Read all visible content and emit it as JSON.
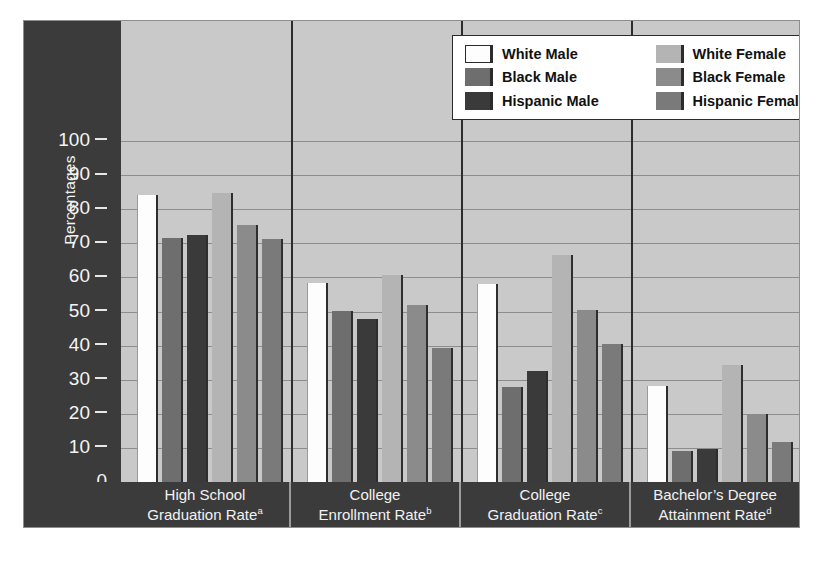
{
  "chart_data": {
    "type": "bar",
    "title": "",
    "xlabel": "",
    "ylabel": "Percentages",
    "ylim": [
      0,
      100
    ],
    "yticks": [
      100,
      90,
      80,
      70,
      60,
      50,
      40,
      30,
      20,
      10,
      0
    ],
    "grid": true,
    "legend_position": "top-right",
    "categories": [
      "High School Graduation Rate",
      "College Enrollment Rate",
      "College Graduation Rate",
      "Bachelor's Degree Attainment Rate"
    ],
    "category_footnotes": [
      "a",
      "b",
      "c",
      "d"
    ],
    "series": [
      {
        "name": "White Male",
        "values": [
          84.3,
          58.5,
          58.0,
          28.2
        ]
      },
      {
        "name": "Black Male",
        "values": [
          71.6,
          50.2,
          27.9,
          9.1
        ]
      },
      {
        "name": "Hispanic Male",
        "values": [
          72.3,
          47.7,
          32.5,
          9.6
        ]
      },
      {
        "name": "White Female",
        "values": [
          84.8,
          60.7,
          66.5,
          34.4
        ]
      },
      {
        "name": "Black Female",
        "values": [
          75.5,
          51.8,
          50.4,
          20.0
        ]
      },
      {
        "name": "Hispanic Female",
        "values": [
          71.4,
          39.3,
          40.5,
          11.7
        ]
      }
    ]
  },
  "legend": {
    "entries": [
      {
        "label": "White Male",
        "swatch": "c-wm"
      },
      {
        "label": "White Female",
        "swatch": "c-wf"
      },
      {
        "label": "Black Male",
        "swatch": "c-bm"
      },
      {
        "label": "Black Female",
        "swatch": "c-bf"
      },
      {
        "label": "Hispanic Male",
        "swatch": "c-hm"
      },
      {
        "label": "Hispanic Female",
        "swatch": "c-hf"
      }
    ]
  },
  "xaxis": {
    "labels": [
      {
        "line1": "High School",
        "line2": "Graduation Rate",
        "note": "a"
      },
      {
        "line1": "College",
        "line2": "Enrollment Rate",
        "note": "b"
      },
      {
        "line1": "College",
        "line2": "Graduation Rate",
        "note": "c"
      },
      {
        "line1": "Bachelor’s Degree",
        "line2": "Attainment Rate",
        "note": "d"
      }
    ]
  },
  "colors": {
    "white_male": "#fdfdfd",
    "black_male": "#6e6e6e",
    "hispanic_male": "#3a3a3a",
    "white_female": "#b4b4b4",
    "black_female": "#8b8b8b",
    "hispanic_female": "#7a7a7a",
    "plot_background": "#c9c9c9",
    "axis_band": "#3b3b3b",
    "gridline": "#8d8d8d",
    "page_background": "#ffffff"
  }
}
